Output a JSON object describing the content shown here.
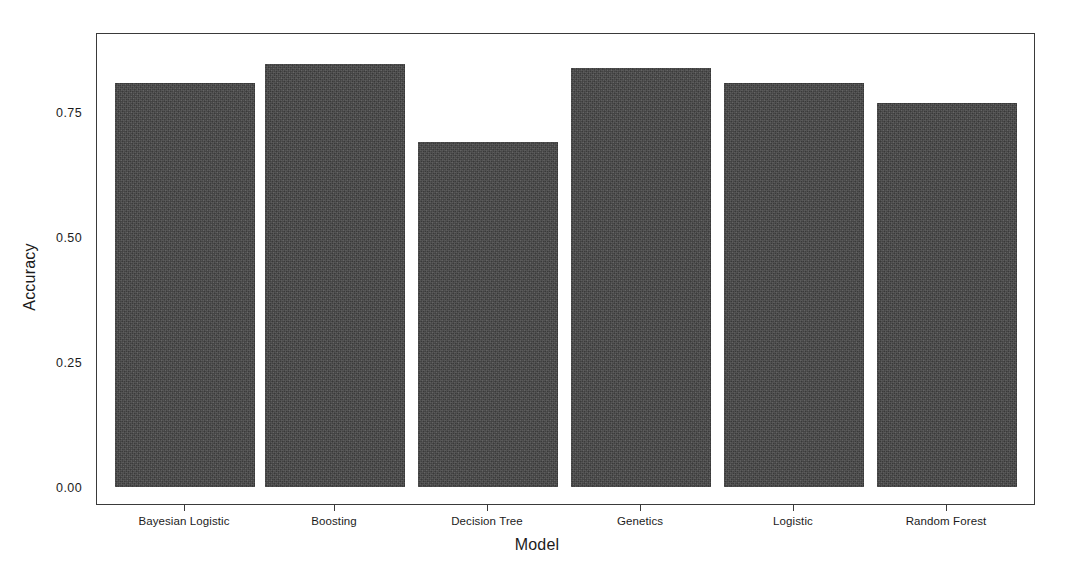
{
  "chart_data": {
    "type": "bar",
    "title": "",
    "subtitle": "",
    "xlabel": "Model",
    "ylabel": "Accuracy",
    "categories": [
      "Bayesian Logistic",
      "Boosting",
      "Decision Tree",
      "Genetics",
      "Logistic",
      "Random Forest"
    ],
    "values": [
      0.82,
      0.86,
      0.7,
      0.85,
      0.82,
      0.78
    ],
    "ylim": [
      0.0,
      0.92
    ],
    "yticks": [
      0.0,
      0.25,
      0.5,
      0.75
    ],
    "ytick_labels": [
      "0.00",
      "0.25",
      "0.50",
      "0.75"
    ],
    "grid": false,
    "legend": null,
    "legend_position": "none",
    "bar_color": "#464646",
    "panel_border_color": "#3a3a3a",
    "background_color": "#ffffff",
    "axis_text_color": "#1c1c1c",
    "annotations": []
  }
}
